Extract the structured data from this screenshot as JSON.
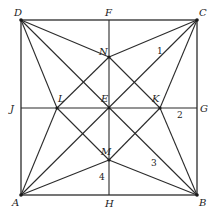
{
  "diagram": {
    "type": "geometry",
    "points": {
      "A": {
        "label": "A",
        "x": 21,
        "y": 195
      },
      "B": {
        "label": "B",
        "x": 197,
        "y": 195
      },
      "C": {
        "label": "C",
        "x": 197,
        "y": 20
      },
      "D": {
        "label": "D",
        "x": 21,
        "y": 20
      },
      "E": {
        "label": "E",
        "x": 109,
        "y": 108
      },
      "F": {
        "label": "F",
        "x": 109,
        "y": 20
      },
      "G": {
        "label": "G",
        "x": 197,
        "y": 108
      },
      "H": {
        "label": "H",
        "x": 109,
        "y": 195
      },
      "J": {
        "label": "J",
        "x": 21,
        "y": 108
      },
      "K": {
        "label": "K",
        "x": 160,
        "y": 108
      },
      "L": {
        "label": "L",
        "x": 57,
        "y": 108
      },
      "M": {
        "label": "M",
        "x": 109,
        "y": 160
      },
      "N": {
        "label": "N",
        "x": 109,
        "y": 57
      }
    },
    "angle_labels": {
      "one": "1",
      "two": "2",
      "three": "3",
      "four": "4"
    },
    "colors": {
      "line": "#2b2b2b",
      "background": "#ffffff"
    }
  }
}
